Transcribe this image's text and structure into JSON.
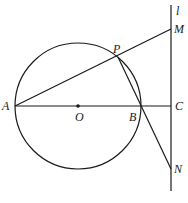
{
  "diagram": {
    "type": "geometry",
    "labels": {
      "A": "A",
      "O": "O",
      "B": "B",
      "C": "C",
      "P": "P",
      "M": "M",
      "N": "N",
      "l": "l"
    },
    "points": {
      "A": [
        15,
        106
      ],
      "O": [
        78,
        106
      ],
      "B": [
        140,
        106
      ],
      "C": [
        171,
        106
      ],
      "P": [
        118,
        57
      ],
      "M": [
        171,
        29
      ],
      "N": [
        171,
        169
      ]
    },
    "circle": {
      "center": "O",
      "radius": 63
    },
    "segments": [
      [
        "A",
        "C"
      ],
      [
        "A",
        "M"
      ],
      [
        "P",
        "N"
      ]
    ],
    "line_l": {
      "x": 171,
      "y1": 5,
      "y2": 191
    },
    "colors": {
      "stroke": "#1a1a1a",
      "background": "#ffffff"
    }
  }
}
